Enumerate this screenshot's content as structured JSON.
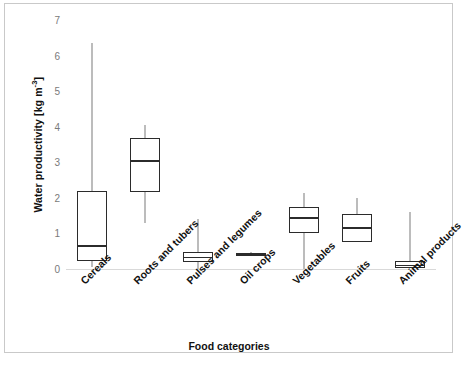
{
  "chart_data": {
    "type": "box",
    "title": "",
    "xlabel": "Food categories",
    "ylabel_text": "Water productivity [kg m",
    "ylabel_exponent": "-3",
    "ylabel_close": "]",
    "ylabel_full": "Water productivity [kg m-3]",
    "categories": [
      "Cereals",
      "Roots and tubers",
      "Pulses and legumes",
      "Oil crops",
      "Vegetables",
      "Fruits",
      "Animal products"
    ],
    "ylim": [
      0,
      7
    ],
    "yticks": [
      0,
      1,
      2,
      3,
      4,
      5,
      6,
      7
    ],
    "ytick_labels": [
      "0",
      "1",
      "2",
      "3",
      "4",
      "5",
      "6",
      "7"
    ],
    "grid": false,
    "legend": "none",
    "boxes": [
      {
        "category": "Cereals",
        "whisker_low": 0.05,
        "q1": 0.22,
        "median": 0.67,
        "q3": 2.19,
        "whisker_high": 6.35
      },
      {
        "category": "Roots and tubers",
        "whisker_low": 1.29,
        "q1": 2.17,
        "median": 3.06,
        "q3": 3.69,
        "whisker_high": 4.05
      },
      {
        "category": "Pulses and legumes",
        "whisker_low": 0.0,
        "q1": 0.19,
        "median": 0.35,
        "q3": 0.47,
        "whisker_high": 1.4
      },
      {
        "category": "Oil crops",
        "whisker_low": 0.36,
        "q1": 0.39,
        "median": 0.42,
        "q3": 0.45,
        "whisker_high": 0.48
      },
      {
        "category": "Vegetables",
        "whisker_low": 0.0,
        "q1": 1.0,
        "median": 1.45,
        "q3": 1.74,
        "whisker_high": 2.14
      },
      {
        "category": "Fruits",
        "whisker_low": 0.77,
        "q1": 0.77,
        "median": 1.17,
        "q3": 1.54,
        "whisker_high": 2.0
      },
      {
        "category": "Animal products",
        "whisker_low": 0.03,
        "q1": 0.03,
        "median": 0.12,
        "q3": 0.22,
        "whisker_high": 1.6
      }
    ]
  },
  "colors": {
    "box_stroke": "#2b2b2b",
    "whisker": "#7b7b7b",
    "axis_line": "#d9d9d9",
    "tick_label": "#7a7a7a",
    "axis_title": "#111111",
    "frame": "#c9c9c9",
    "background": "#ffffff"
  },
  "caption": {
    "text": ""
  }
}
